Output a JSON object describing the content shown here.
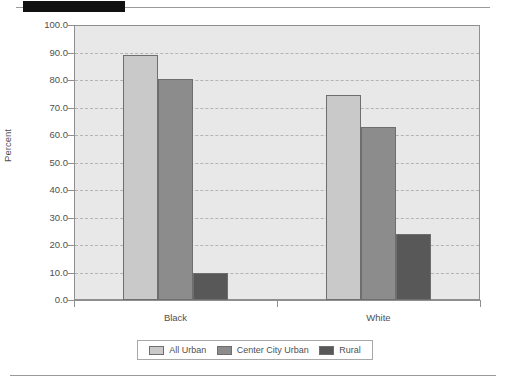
{
  "header": {
    "tab_marker": "",
    "rule": ""
  },
  "chart_data": {
    "type": "bar",
    "title": "",
    "xlabel": "",
    "ylabel": "Percent",
    "categories": [
      "Black",
      "White"
    ],
    "series": [
      {
        "name": "All Urban",
        "color": "#c9c9c9",
        "values": [
          89.0,
          74.5
        ]
      },
      {
        "name": "Center City Urban",
        "color": "#8c8c8c",
        "values": [
          80.5,
          63.0
        ]
      },
      {
        "name": "Rural",
        "color": "#585858",
        "values": [
          10.0,
          24.0
        ]
      }
    ],
    "ylim": [
      0,
      100
    ],
    "ytick_step": 10,
    "ytick_labels": [
      "100.0",
      "90.0",
      "80.0",
      "70.0",
      "60.0",
      "50.0",
      "40.0",
      "30.0",
      "20.0",
      "10.0",
      "0.0"
    ],
    "ytick_values": [
      100,
      90,
      80,
      70,
      60,
      50,
      40,
      30,
      20,
      10,
      0
    ],
    "grid": true,
    "legend_position": "bottom",
    "plot_background": "#e8e8e8",
    "axis_color": "#8f8f8f",
    "gridline_color": "#b4b4b4"
  }
}
